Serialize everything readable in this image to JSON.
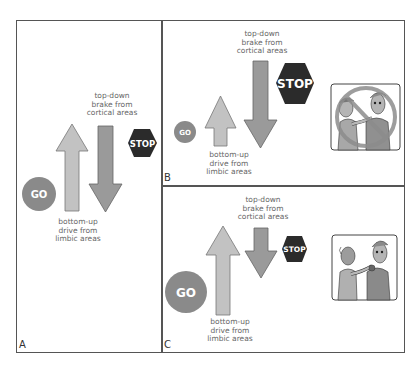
{
  "figure": {
    "panels": [
      {
        "id": "A",
        "label": "A",
        "top_caption": "top-down\nbrake from\ncortical areas",
        "bottom_caption": "bottom-up\ndrive from\nlimbic areas",
        "go_label": "GO",
        "stop_label": "STOP",
        "image": null
      },
      {
        "id": "B",
        "label": "B",
        "top_caption": "top-down\nbrake from\ncortical areas",
        "bottom_caption": "bottom-up\ndrive from\nlimbic areas",
        "go_label": "GO",
        "stop_label": "STOP",
        "image": "two people in confrontation, crossed-out prohibition sign"
      },
      {
        "id": "C",
        "label": "C",
        "top_caption": "top-down\nbrake from\ncortical areas",
        "bottom_caption": "bottom-up\ndrive from\nlimbic areas",
        "go_label": "GO",
        "stop_label": "STOP",
        "image": "one person grabbing another by the collar"
      }
    ]
  },
  "colors": {
    "go_circle": "#8a8a8a",
    "stop_sign": "#2b2b2b",
    "up_arrow": "#c2c2c2",
    "down_arrow": "#9a9a9a",
    "prohibition": "#8c8c8c",
    "frame": "#555555"
  }
}
